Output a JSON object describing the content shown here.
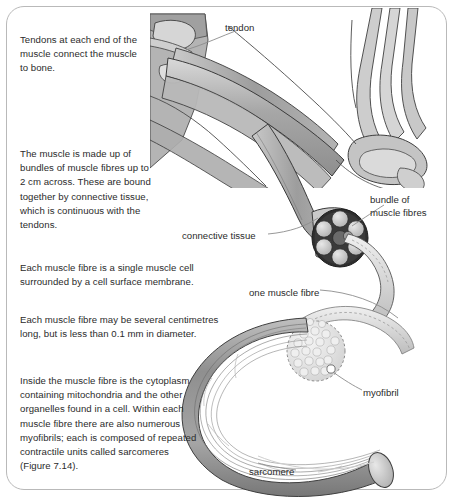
{
  "figure": {
    "border_color": "#b9b9b9",
    "background_color": "#ffffff",
    "text_color": "#2b2b2b"
  },
  "paragraphs": [
    {
      "id": "tendons",
      "text": "Tendons at each end of the\nmuscle connect the muscle\nto bone."
    },
    {
      "id": "bundles",
      "text": "The muscle is made up of\nbundles of muscle fibres up to\n2 cm across. These are bound\ntogether by connective tissue,\nwhich is continuous with the\ntendons."
    },
    {
      "id": "single-cell",
      "text": "Each muscle fibre is a single muscle cell\nsurrounded by a cell surface membrane."
    },
    {
      "id": "dimensions",
      "text": "Each muscle fibre may be several centimetres\nlong, but is less than 0.1 mm in diameter."
    },
    {
      "id": "cytoplasm",
      "text": "Inside the muscle fibre is the cytoplasm\ncontaining mitochondria and the other\norganelles found in a cell. Within each\nmuscle fibre there are also numerous\nmyofibrils; each is composed of repeated\ncontractile units called sarcomeres\n(Figure 7.14)."
    }
  ],
  "callouts": {
    "tendon": "tendon",
    "bundle_of_muscle_fibres": "bundle of\nmuscle fibres",
    "connective_tissue": "connective tissue",
    "one_muscle_fibre": "one muscle fibre",
    "myofibril": "myofibril",
    "sarcomere": "sarcomere"
  },
  "artwork_colors": {
    "muscle_mid": "#9a9a9a",
    "muscle_light": "#c6c6c6",
    "muscle_pale": "#dcdcdc",
    "bone_light": "#d2d2d2",
    "outline": "#3a3a3a",
    "leader_line": "#8c8c8c",
    "bundle_ring": "#2e2e2e",
    "fibre_fill": "#b2b2b2",
    "myofibril_fill": "#e2e2e2"
  }
}
